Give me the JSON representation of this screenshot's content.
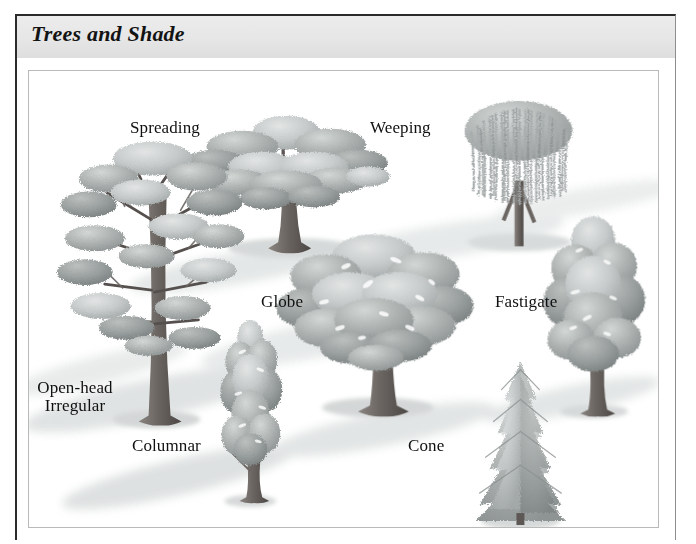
{
  "figure": {
    "title": "Trees and Shade",
    "border_color": "#2b2b2b",
    "header_bg": "#e8e8e8",
    "panel_bg": "#ffffff"
  },
  "illustration": {
    "description": "Grayscale illustration of seven tree forms casting shadows on open ground",
    "palette": {
      "foliage_light": "#cfd2d1",
      "foliage_mid": "#a9adad",
      "foliage_dark": "#868b8b",
      "trunk": "#6f6a66",
      "trunk_dark": "#4f4a47",
      "shadow": "#d9dcdc",
      "shadow_soft": "#e9ecec"
    },
    "trees": [
      {
        "id": "spreading",
        "label": "Spreading",
        "form": "wide flat-topped canopy"
      },
      {
        "id": "weeping",
        "label": "Weeping",
        "form": "drooping curtain of strands"
      },
      {
        "id": "globe",
        "label": "Globe",
        "form": "rounded dense crown"
      },
      {
        "id": "fastigate",
        "label": "Fastigate",
        "form": "upright narrow oval"
      },
      {
        "id": "open-head",
        "label": "Open-head\nIrregular",
        "form": "layered open branching"
      },
      {
        "id": "columnar",
        "label": "Columnar",
        "form": "tall slim column"
      },
      {
        "id": "cone",
        "label": "Cone",
        "form": "conical conifer"
      }
    ]
  },
  "labels": {
    "spreading": "Spreading",
    "weeping": "Weeping",
    "globe": "Globe",
    "fastigate": "Fastigate",
    "open_head_line1": "Open-head",
    "open_head_line2": "Irregular",
    "columnar": "Columnar",
    "cone": "Cone"
  }
}
